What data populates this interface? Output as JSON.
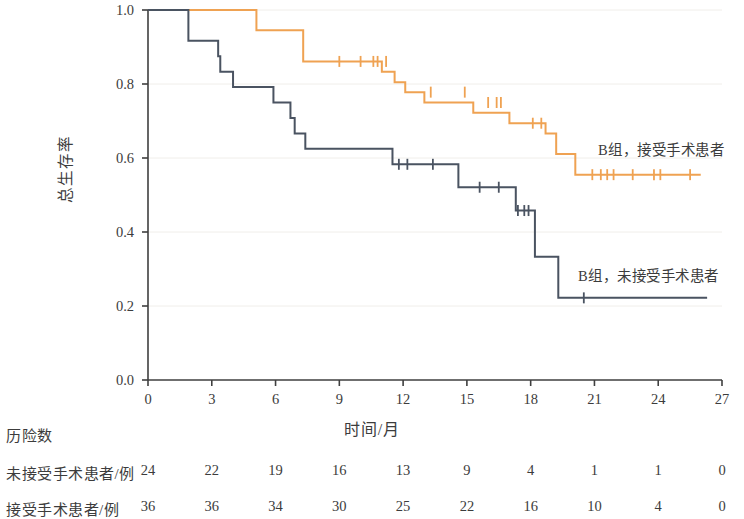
{
  "chart_data": {
    "type": "line",
    "title": "",
    "xlabel": "时间/月",
    "ylabel": "总生存率",
    "xlim": [
      0,
      27
    ],
    "ylim": [
      0.0,
      1.0
    ],
    "xticks": [
      0,
      3,
      6,
      9,
      12,
      15,
      18,
      21,
      24,
      27
    ],
    "xtick_labels": [
      "0",
      "3",
      "6",
      "9",
      "12",
      "15",
      "18",
      "21",
      "24",
      "27"
    ],
    "yticks": [
      0.0,
      0.2,
      0.4,
      0.6,
      0.8,
      1.0
    ],
    "ytick_labels": [
      "0.0",
      "0.2",
      "0.4",
      "0.6",
      "0.8",
      "1.0"
    ],
    "grid": "horizontal-faint",
    "legend_position": "inline-annotation",
    "series": [
      {
        "name": "B组，接受手术患者",
        "color": "#EFA252",
        "steps": [
          [
            0.0,
            1.0
          ],
          [
            2.0,
            1.0
          ],
          [
            5.1,
            1.0
          ],
          [
            5.1,
            0.945
          ],
          [
            7.3,
            0.945
          ],
          [
            7.3,
            0.861
          ],
          [
            11.0,
            0.861
          ],
          [
            11.0,
            0.833
          ],
          [
            11.6,
            0.833
          ],
          [
            11.6,
            0.805
          ],
          [
            12.1,
            0.805
          ],
          [
            12.1,
            0.778
          ],
          [
            13.0,
            0.778
          ],
          [
            13.0,
            0.75
          ],
          [
            15.3,
            0.75
          ],
          [
            15.3,
            0.722
          ],
          [
            17.0,
            0.722
          ],
          [
            17.0,
            0.694
          ],
          [
            18.7,
            0.694
          ],
          [
            18.7,
            0.666
          ],
          [
            19.2,
            0.666
          ],
          [
            19.2,
            0.611
          ],
          [
            20.1,
            0.611
          ],
          [
            20.1,
            0.555
          ],
          [
            26.0,
            0.555
          ]
        ],
        "censor_points": [
          [
            9.0,
            0.861
          ],
          [
            10.0,
            0.861
          ],
          [
            10.6,
            0.861
          ],
          [
            10.8,
            0.861
          ],
          [
            11.2,
            0.861
          ],
          [
            13.3,
            0.778
          ],
          [
            14.9,
            0.778
          ],
          [
            16.0,
            0.75
          ],
          [
            16.4,
            0.75
          ],
          [
            16.6,
            0.75
          ],
          [
            18.1,
            0.694
          ],
          [
            18.5,
            0.694
          ],
          [
            20.9,
            0.555
          ],
          [
            21.3,
            0.555
          ],
          [
            21.6,
            0.555
          ],
          [
            21.9,
            0.555
          ],
          [
            22.8,
            0.555
          ],
          [
            23.8,
            0.555
          ],
          [
            24.1,
            0.555
          ],
          [
            25.5,
            0.555
          ]
        ]
      },
      {
        "name": "B组，未接受手术患者",
        "color": "#4A5361",
        "steps": [
          [
            0.0,
            1.0
          ],
          [
            1.9,
            1.0
          ],
          [
            1.9,
            0.917
          ],
          [
            3.3,
            0.917
          ],
          [
            3.3,
            0.875
          ],
          [
            3.4,
            0.875
          ],
          [
            3.4,
            0.833
          ],
          [
            4.0,
            0.833
          ],
          [
            4.0,
            0.792
          ],
          [
            5.9,
            0.792
          ],
          [
            5.9,
            0.75
          ],
          [
            6.7,
            0.75
          ],
          [
            6.7,
            0.708
          ],
          [
            6.9,
            0.708
          ],
          [
            6.9,
            0.666
          ],
          [
            7.4,
            0.666
          ],
          [
            7.4,
            0.625
          ],
          [
            11.5,
            0.625
          ],
          [
            11.5,
            0.583
          ],
          [
            14.6,
            0.583
          ],
          [
            14.6,
            0.521
          ],
          [
            17.3,
            0.521
          ],
          [
            17.3,
            0.458
          ],
          [
            18.2,
            0.458
          ],
          [
            18.2,
            0.333
          ],
          [
            19.3,
            0.333
          ],
          [
            19.3,
            0.222
          ],
          [
            26.3,
            0.222
          ]
        ],
        "censor_points": [
          [
            11.8,
            0.583
          ],
          [
            12.2,
            0.583
          ],
          [
            13.4,
            0.583
          ],
          [
            15.6,
            0.521
          ],
          [
            16.5,
            0.521
          ],
          [
            17.4,
            0.458
          ],
          [
            17.7,
            0.458
          ],
          [
            17.9,
            0.458
          ],
          [
            20.5,
            0.222
          ]
        ]
      }
    ]
  },
  "axis": {
    "ylabel": "总生存率",
    "xlabel": "时间/月",
    "ytick_labels": [
      "1.0",
      "0.8",
      "0.6",
      "0.4",
      "0.2",
      "0.0"
    ],
    "xtick_labels": [
      "0",
      "3",
      "6",
      "9",
      "12",
      "15",
      "18",
      "21",
      "24",
      "27"
    ]
  },
  "annotations": {
    "surgery": "B组，接受手术患者",
    "no_surgery": "B组，未接受手术患者"
  },
  "risk_table": {
    "title": "历险数",
    "rows": [
      {
        "label": "未接受手术患者/例",
        "values": [
          "24",
          "22",
          "19",
          "16",
          "13",
          "9",
          "4",
          "1",
          "1",
          "0"
        ]
      },
      {
        "label": "接受手术患者/例",
        "values": [
          "36",
          "36",
          "34",
          "30",
          "25",
          "22",
          "16",
          "10",
          "4",
          "0"
        ]
      }
    ]
  },
  "colors": {
    "surgery_curve": "#EFA252",
    "no_surgery_curve": "#4A5361",
    "axis": "#3f3f3f",
    "grid": "#f0eeea"
  }
}
